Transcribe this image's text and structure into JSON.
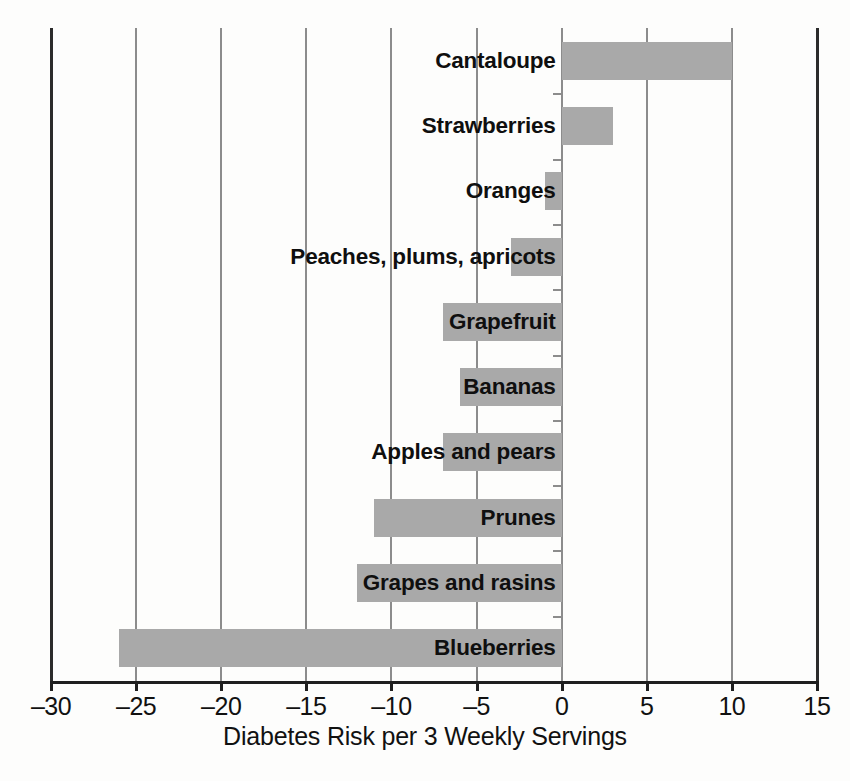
{
  "chart_data": {
    "type": "bar",
    "orientation": "horizontal",
    "title": "",
    "xlabel": "Diabetes Risk per 3 Weekly Servings",
    "ylabel": "",
    "xlim": [
      -30,
      15
    ],
    "xticks": [
      -30,
      -25,
      -20,
      -15,
      -10,
      -5,
      0,
      5,
      10,
      15
    ],
    "xticklabels": [
      "–30",
      "–25",
      "–20",
      "–15",
      "–10",
      "–5",
      "0",
      "5",
      "10",
      "15"
    ],
    "grid": true,
    "legend": null,
    "bar_color": "#a9a9a9",
    "categories": [
      "Cantaloupe",
      "Strawberries",
      "Oranges",
      "Peaches, plums, apricots",
      "Grapefruit",
      "Bananas",
      "Apples and pears",
      "Prunes",
      "Grapes and rasins",
      "Blueberries"
    ],
    "values": [
      10,
      3,
      -1,
      -3,
      -7,
      -6,
      -7,
      -11,
      -12,
      -26
    ]
  },
  "axis": {
    "xlabel": "Diabetes Risk per 3 Weekly Servings"
  }
}
